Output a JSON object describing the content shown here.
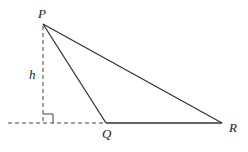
{
  "diagram": {
    "type": "triangle-with-height",
    "labels": {
      "P": "P",
      "Q": "Q",
      "R": "R",
      "h": "h"
    },
    "points": {
      "P": [
        43,
        24
      ],
      "Q": [
        106,
        123
      ],
      "R": [
        222,
        123
      ],
      "foot": [
        43,
        123
      ]
    },
    "colors": {
      "stroke": "#333333",
      "background": "#ffffff"
    }
  }
}
